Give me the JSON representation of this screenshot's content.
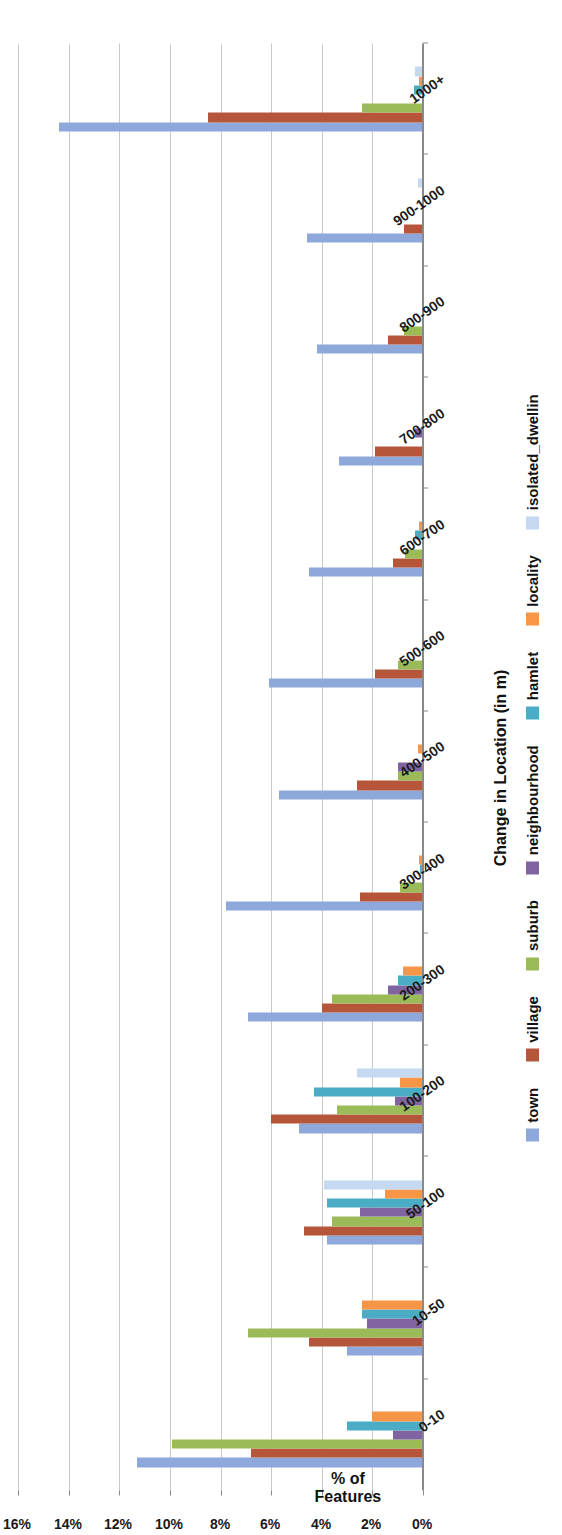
{
  "chart_data": {
    "type": "bar",
    "orientation": "vertical-grouped",
    "title": "",
    "xlabel": "Change in Location (in m)",
    "ylabel": "% of Features",
    "ylabel_line1": "% of",
    "ylabel_line2": "Features",
    "ylim": [
      0,
      16
    ],
    "ytick_labels": [
      "0%",
      "2%",
      "4%",
      "6%",
      "8%",
      "10%",
      "12%",
      "14%",
      "16%"
    ],
    "ytick_values": [
      0,
      2,
      4,
      6,
      8,
      10,
      12,
      14,
      16
    ],
    "grid": true,
    "legend_position": "bottom",
    "categories": [
      "0-10",
      "10-50",
      "50-100",
      "100-200",
      "200-300",
      "300-400",
      "400-500",
      "500-600",
      "600-700",
      "700-800",
      "800-900",
      "900-1000",
      "1000+"
    ],
    "series": [
      {
        "name": "town",
        "color": "#8FA8DC",
        "values": [
          11.3,
          3.0,
          3.8,
          4.9,
          6.9,
          7.8,
          5.7,
          6.1,
          4.5,
          3.3,
          4.2,
          4.6,
          14.4
        ]
      },
      {
        "name": "village",
        "color": "#B5563A",
        "values": [
          6.8,
          4.5,
          4.7,
          6.0,
          4.0,
          2.5,
          2.6,
          1.9,
          1.2,
          1.9,
          1.4,
          0.75,
          8.5
        ]
      },
      {
        "name": "suburb",
        "color": "#9BBB59",
        "values": [
          9.9,
          6.9,
          3.6,
          3.4,
          3.6,
          0.9,
          1.0,
          1.0,
          0.7,
          0.0,
          0.75,
          0.0,
          2.4
        ]
      },
      {
        "name": "neighbourhood",
        "color": "#8064A2",
        "values": [
          1.2,
          2.2,
          2.5,
          1.1,
          1.4,
          0.05,
          1.0,
          0.05,
          0.05,
          0.3,
          0.0,
          0.0,
          0.0
        ]
      },
      {
        "name": "hamlet",
        "color": "#4BACC6",
        "values": [
          3.0,
          2.4,
          3.8,
          4.3,
          1.0,
          0.1,
          0.05,
          0.05,
          0.3,
          0.0,
          0.0,
          0.0,
          0.35
        ]
      },
      {
        "name": "locality",
        "color": "#F79646",
        "values": [
          2.0,
          2.4,
          1.5,
          0.9,
          0.8,
          0.15,
          0.2,
          0.05,
          0.15,
          0.0,
          0.0,
          0.0,
          0.15
        ]
      },
      {
        "name": "isolated_dwellin",
        "color": "#C6D9F1",
        "values": [
          0.0,
          0.0,
          3.9,
          2.6,
          0.0,
          0.0,
          0.0,
          0.0,
          0.0,
          0.0,
          0.0,
          0.2,
          0.3
        ]
      }
    ]
  },
  "legend": {
    "items": [
      {
        "label": "town",
        "color": "#8FA8DC"
      },
      {
        "label": "village",
        "color": "#B5563A"
      },
      {
        "label": "suburb",
        "color": "#9BBB59"
      },
      {
        "label": "neighbourhood",
        "color": "#8064A2"
      },
      {
        "label": "hamlet",
        "color": "#4BACC6"
      },
      {
        "label": "locality",
        "color": "#F79646"
      },
      {
        "label": "isolated_dwellin",
        "color": "#C6D9F1"
      }
    ]
  }
}
